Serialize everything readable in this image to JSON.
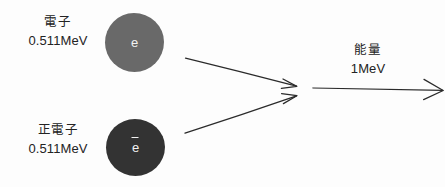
{
  "diagram": {
    "background_color": "#fdfdfd",
    "stroke_color": "#2b2b2b"
  },
  "particles": [
    {
      "id": "electron",
      "name_label": "電子",
      "energy_label": "0.511MeV",
      "symbol": "e",
      "has_overbar": false,
      "fill_color": "#696969"
    },
    {
      "id": "positron",
      "name_label": "正電子",
      "energy_label": "0.511MeV",
      "symbol": "e",
      "has_overbar": true,
      "fill_color": "#333333"
    }
  ],
  "output": {
    "name_label": "能量",
    "energy_label": "1MeV"
  },
  "arrows": [
    {
      "id": "electron-path",
      "from": [
        185,
        58
      ],
      "to": [
        297,
        86
      ]
    },
    {
      "id": "positron-path",
      "from": [
        185,
        133
      ],
      "to": [
        297,
        96
      ]
    },
    {
      "id": "photon-path",
      "from": [
        313,
        88
      ],
      "to": [
        443,
        90
      ]
    }
  ]
}
